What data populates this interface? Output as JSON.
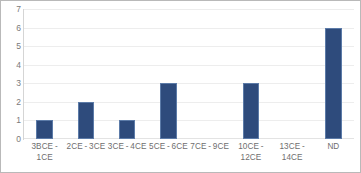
{
  "chart_data": {
    "type": "bar",
    "title": "",
    "subtitle": "",
    "xlabel": "",
    "ylabel": "",
    "categories": [
      "3BCE - 1CE",
      "2CE - 3CE",
      "3CE - 4CE",
      "5CE - 6CE",
      "7CE - 9CE",
      "10CE - 12CE",
      "13CE - 14CE",
      "ND"
    ],
    "values": [
      1,
      2,
      1,
      3,
      0,
      3,
      0,
      6
    ],
    "ylim": [
      0,
      7
    ],
    "y_ticks": [
      0,
      1,
      2,
      3,
      4,
      5,
      6,
      7
    ],
    "y_tick_labels": [
      "0",
      "1",
      "2",
      "3",
      "4",
      "5",
      "6",
      "7"
    ],
    "grid": true,
    "grid_axis": "y",
    "legend": false,
    "legend_position": "none",
    "annotations": [],
    "colors": {
      "bar_fill": "#2e4b7c",
      "bar_stroke": "#5c7ba8",
      "gridline": "#ededed",
      "axis_line": "#d5d5d5",
      "tick_text": "#7a7a7a",
      "frame_border": "#b9b9b9",
      "background": "#ffffff"
    }
  }
}
